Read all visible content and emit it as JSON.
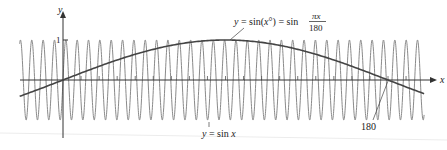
{
  "chart_data": {
    "type": "line",
    "title": "",
    "xlabel": "x",
    "ylabel": "y",
    "xlim": [
      -24,
      206
    ],
    "ylim": [
      -1,
      1
    ],
    "grid": false,
    "legend": "none (curves labeled by annotations)",
    "y_tick_labels": [
      "1"
    ],
    "x_tick_spacing": 10,
    "annotations": [
      {
        "text": "y = sin(x°) = sin πx/180",
        "target": "sin(x°) curve near peak"
      },
      {
        "text": "y = sin x",
        "target": "sin x curve"
      },
      {
        "text": "180",
        "target": "x-intercept of sin(x°) curve"
      }
    ],
    "series": [
      {
        "name": "y = sin x",
        "function": "sin(x)",
        "color": "#8a8a8a",
        "width": 1
      },
      {
        "name": "y = sin(x°)",
        "function": "sin(pi*x/180)",
        "color": "#444444",
        "width": 1.6
      }
    ],
    "key_points": {
      "sin_deg_zero": [
        0,
        0
      ],
      "sin_deg_peak": [
        90,
        1
      ],
      "sin_deg_zero_2": [
        180,
        0
      ]
    }
  },
  "axes": {
    "x_label": "x",
    "y_label": "y",
    "y_tick_one": "1"
  },
  "labels": {
    "deg_label_prefix": "y = sin(x°) = sin",
    "deg_label_num": "πx",
    "deg_label_den": "180",
    "rad_label": "y = sin x",
    "x_intercept": "180"
  },
  "colors": {
    "axis": "#333333",
    "sin_rad": "#8a8a8a",
    "sin_deg": "#444444",
    "text": "#222222"
  }
}
